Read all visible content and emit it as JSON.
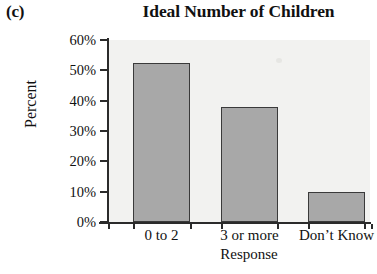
{
  "panel": {
    "label": "(c)"
  },
  "chart_data": {
    "type": "bar",
    "title": "Ideal Number of Children",
    "xlabel": "Response",
    "ylabel": "Percent",
    "categories": [
      "0 to 2",
      "3 or more",
      "Don’t Know"
    ],
    "values": [
      52.5,
      38,
      10
    ],
    "ylim": [
      0,
      60
    ],
    "yticks": [
      0,
      10,
      20,
      30,
      40,
      50,
      60
    ],
    "ytick_labels": [
      "0%",
      "10%",
      "20%",
      "30%",
      "40%",
      "50%",
      "60%"
    ],
    "grid": false,
    "legend": false,
    "bar_fill": "#a8a8a8",
    "bar_edge": "#3a3a3a",
    "plot_background": "#f2f2f0"
  }
}
